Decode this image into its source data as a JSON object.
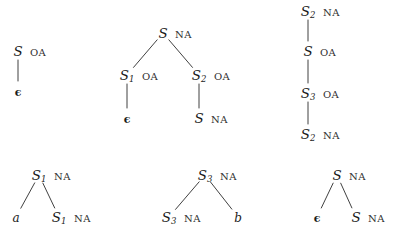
{
  "figure": {
    "type": "derivation-trees",
    "background_color": "#ffffff",
    "ink_color": "#1c1c1c",
    "feature_labels": [
      "OA",
      "NA"
    ],
    "symbols": {
      "epsilon": "ϵ",
      "S": "S",
      "a": "a",
      "b": "b"
    },
    "trees": [
      {
        "id": "tree-1",
        "nodes": [
          {
            "id": "t1-root",
            "label": "S",
            "subscript": "",
            "feature": "OA",
            "x": 18,
            "y": 51,
            "kind": "nonterminal"
          },
          {
            "id": "t1-child",
            "label": "ϵ",
            "subscript": "",
            "feature": "",
            "x": 18,
            "y": 91,
            "kind": "epsilon"
          }
        ],
        "edges": [
          {
            "from": "t1-root",
            "to": "t1-child"
          }
        ]
      },
      {
        "id": "tree-2",
        "nodes": [
          {
            "id": "t2-root",
            "label": "S",
            "subscript": "",
            "feature": "NA",
            "x": 163,
            "y": 33,
            "kind": "nonterminal"
          },
          {
            "id": "t2-left",
            "label": "S",
            "subscript": "1",
            "feature": "OA",
            "x": 127,
            "y": 75,
            "kind": "nonterminal"
          },
          {
            "id": "t2-right",
            "label": "S",
            "subscript": "2",
            "feature": "OA",
            "x": 199,
            "y": 75,
            "kind": "nonterminal"
          },
          {
            "id": "t2-left-child",
            "label": "ϵ",
            "subscript": "",
            "feature": "",
            "x": 127,
            "y": 118,
            "kind": "epsilon"
          },
          {
            "id": "t2-right-child",
            "label": "S",
            "subscript": "",
            "feature": "NA",
            "x": 199,
            "y": 118,
            "kind": "nonterminal"
          }
        ],
        "edges": [
          {
            "from": "t2-root",
            "to": "t2-left"
          },
          {
            "from": "t2-root",
            "to": "t2-right"
          },
          {
            "from": "t2-left",
            "to": "t2-left-child"
          },
          {
            "from": "t2-right",
            "to": "t2-right-child"
          }
        ]
      },
      {
        "id": "tree-3",
        "nodes": [
          {
            "id": "t3-n1",
            "label": "S",
            "subscript": "2",
            "feature": "NA",
            "x": 308,
            "y": 11,
            "kind": "nonterminal"
          },
          {
            "id": "t3-n2",
            "label": "S",
            "subscript": "",
            "feature": "OA",
            "x": 308,
            "y": 51,
            "kind": "nonterminal"
          },
          {
            "id": "t3-n3",
            "label": "S",
            "subscript": "3",
            "feature": "OA",
            "x": 308,
            "y": 93,
            "kind": "nonterminal"
          },
          {
            "id": "t3-n4",
            "label": "S",
            "subscript": "2",
            "feature": "NA",
            "x": 308,
            "y": 134,
            "kind": "nonterminal"
          }
        ],
        "edges": [
          {
            "from": "t3-n1",
            "to": "t3-n2"
          },
          {
            "from": "t3-n2",
            "to": "t3-n3"
          },
          {
            "from": "t3-n3",
            "to": "t3-n4"
          }
        ]
      },
      {
        "id": "tree-4",
        "nodes": [
          {
            "id": "t4-root",
            "label": "S",
            "subscript": "1",
            "feature": "NA",
            "x": 39,
            "y": 175,
            "kind": "nonterminal"
          },
          {
            "id": "t4-left",
            "label": "a",
            "subscript": "",
            "feature": "",
            "x": 16,
            "y": 217,
            "kind": "terminal"
          },
          {
            "id": "t4-right",
            "label": "S",
            "subscript": "1",
            "feature": "NA",
            "x": 59,
            "y": 217,
            "kind": "nonterminal"
          }
        ],
        "edges": [
          {
            "from": "t4-root",
            "to": "t4-left"
          },
          {
            "from": "t4-root",
            "to": "t4-right"
          }
        ]
      },
      {
        "id": "tree-5",
        "nodes": [
          {
            "id": "t5-root",
            "label": "S",
            "subscript": "3",
            "feature": "NA",
            "x": 205,
            "y": 175,
            "kind": "nonterminal"
          },
          {
            "id": "t5-left",
            "label": "S",
            "subscript": "3",
            "feature": "NA",
            "x": 169,
            "y": 217,
            "kind": "nonterminal"
          },
          {
            "id": "t5-right",
            "label": "b",
            "subscript": "",
            "feature": "",
            "x": 238,
            "y": 217,
            "kind": "terminal"
          }
        ],
        "edges": [
          {
            "from": "t5-root",
            "to": "t5-left"
          },
          {
            "from": "t5-root",
            "to": "t5-right"
          }
        ]
      },
      {
        "id": "tree-6",
        "nodes": [
          {
            "id": "t6-root",
            "label": "S",
            "subscript": "",
            "feature": "NA",
            "x": 337,
            "y": 175,
            "kind": "nonterminal"
          },
          {
            "id": "t6-left",
            "label": "ϵ",
            "subscript": "",
            "feature": "",
            "x": 317,
            "y": 217,
            "kind": "epsilon"
          },
          {
            "id": "t6-right",
            "label": "S",
            "subscript": "",
            "feature": "NA",
            "x": 356,
            "y": 217,
            "kind": "nonterminal"
          }
        ],
        "edges": [
          {
            "from": "t6-root",
            "to": "t6-left"
          },
          {
            "from": "t6-root",
            "to": "t6-right"
          }
        ]
      }
    ]
  }
}
